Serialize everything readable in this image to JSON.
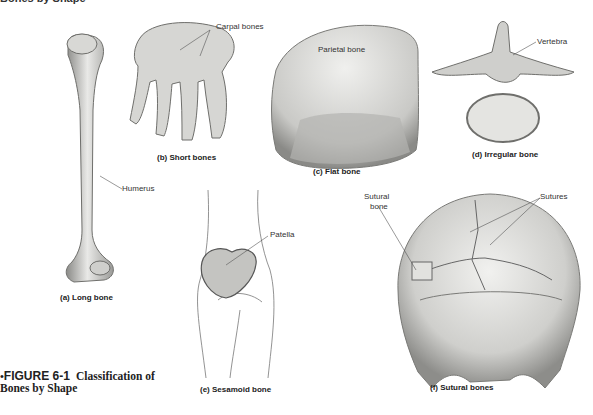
{
  "header_partial": "Bones by Shape",
  "figure": {
    "bullet": "•",
    "number": "FIGURE 6-1",
    "title_line1": "Classification of",
    "title_line2": "Bones by Shape"
  },
  "panels": [
    {
      "id": "a",
      "caption": "(a) Long bone",
      "labels": [
        "Humerus"
      ]
    },
    {
      "id": "b",
      "caption": "(b) Short bones",
      "labels": [
        "Carpal bones"
      ]
    },
    {
      "id": "c",
      "caption": "(c) Flat bone",
      "labels": [
        "Parietal bone"
      ]
    },
    {
      "id": "d",
      "caption": "(d) Irregular bone",
      "labels": [
        "Vertebra"
      ]
    },
    {
      "id": "e",
      "caption": "(e) Sesamoid bone",
      "labels": [
        "Patella"
      ]
    },
    {
      "id": "f",
      "caption": "(f) Sutural bones",
      "labels": [
        "Sutural",
        "bone",
        "Sutures"
      ]
    }
  ],
  "colors": {
    "bone_light": "#e8e8e6",
    "bone_mid": "#b9b9b6",
    "bone_dark": "#6f6f6c",
    "line": "#555555"
  }
}
